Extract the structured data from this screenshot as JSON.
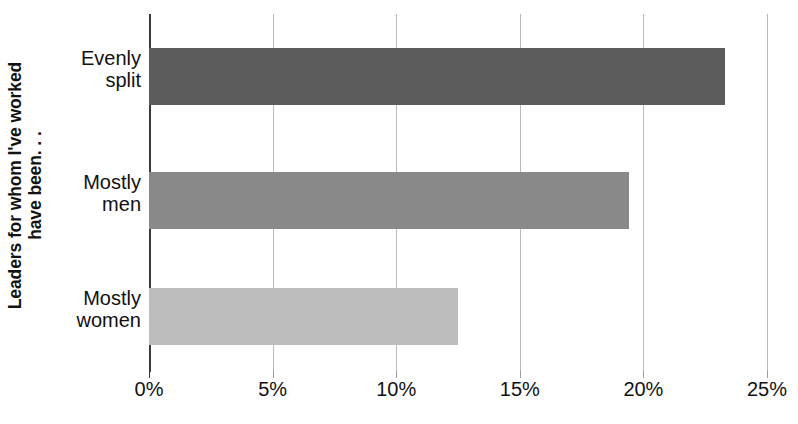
{
  "chart_data": {
    "type": "bar",
    "orientation": "horizontal",
    "title": "",
    "xlabel": "",
    "ylabel": "Leaders for whom I've worked have been. . .",
    "ylabel_lines": [
      "Leaders for whom I've worked",
      "have been. . ."
    ],
    "categories": [
      "Evenly split",
      "Mostly men",
      "Mostly women"
    ],
    "category_lines": [
      [
        "Evenly",
        "split"
      ],
      [
        "Mostly",
        "men"
      ],
      [
        "Mostly",
        "women"
      ]
    ],
    "values": [
      23.3,
      19.4,
      12.5
    ],
    "value_labels": [
      "23.3%",
      "19.4%",
      "12.5%"
    ],
    "xlim": [
      0,
      25
    ],
    "xticks": [
      0,
      5,
      10,
      15,
      20,
      25
    ],
    "xtick_labels": [
      "0%",
      "5%",
      "10%",
      "15%",
      "20%",
      "25%"
    ],
    "grid": "vertical",
    "legend": "none",
    "bar_colors": [
      "#5c5c5c",
      "#898989",
      "#bdbdbd"
    ]
  },
  "style": {
    "background": "#ffffff",
    "gridline_color": "#b9b9b9",
    "axis_color": "#3a3a3a",
    "text_color": "#111111"
  }
}
